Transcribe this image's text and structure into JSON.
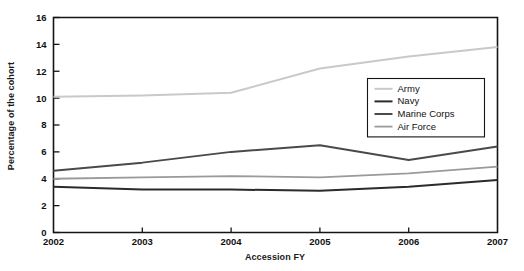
{
  "chart_data": {
    "type": "line",
    "title": "",
    "xlabel": "Accession FY",
    "ylabel": "Percentage of the cohort",
    "x": [
      2002,
      2003,
      2004,
      2005,
      2006,
      2007
    ],
    "categories": [
      "2002",
      "2003",
      "2004",
      "2005",
      "2006",
      "2007"
    ],
    "xlim": [
      2002,
      2007
    ],
    "ylim": [
      0,
      16
    ],
    "yticks": [
      0,
      2,
      4,
      6,
      8,
      10,
      12,
      14,
      16
    ],
    "ytick_labels": [
      "0",
      "2",
      "4",
      "6",
      "8",
      "10",
      "12",
      "14",
      "16"
    ],
    "xticks": [
      2002,
      2003,
      2004,
      2005,
      2006,
      2007
    ],
    "xtick_labels": [
      "2002",
      "2003",
      "2004",
      "2005",
      "2006",
      "2007"
    ],
    "grid": false,
    "legend_position": "center-right-inside",
    "series": [
      {
        "name": "Army",
        "color": "#c9c9c9",
        "width": 2.0,
        "values": [
          10.1,
          10.2,
          10.4,
          12.2,
          13.1,
          13.8
        ]
      },
      {
        "name": "Navy",
        "color": "#2b2b2b",
        "width": 2.0,
        "values": [
          3.4,
          3.2,
          3.2,
          3.1,
          3.4,
          3.9
        ]
      },
      {
        "name": "Marine Corps",
        "color": "#4a4a4a",
        "width": 2.0,
        "values": [
          4.6,
          5.2,
          6.0,
          6.5,
          5.4,
          6.4
        ]
      },
      {
        "name": "Air Force",
        "color": "#9a9a9a",
        "width": 1.8,
        "values": [
          4.0,
          4.1,
          4.2,
          4.1,
          4.4,
          4.9
        ]
      }
    ]
  },
  "legend": {
    "entries": [
      {
        "label": "Army"
      },
      {
        "label": "Navy"
      },
      {
        "label": "Marine Corps"
      },
      {
        "label": "Air Force"
      }
    ]
  },
  "axes": {
    "x_title": "Accession FY",
    "y_title": "Percentage of the cohort"
  }
}
